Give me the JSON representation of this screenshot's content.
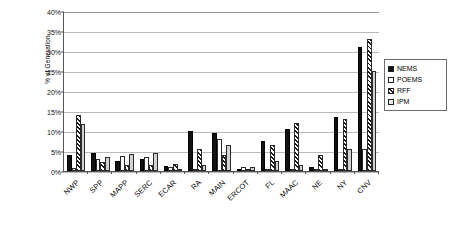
{
  "chart_data": {
    "type": "bar",
    "title": "",
    "xlabel": "",
    "ylabel": "% of Generation",
    "ylim": [
      0,
      40
    ],
    "ytick_labels": [
      "0%",
      "5%",
      "10%",
      "15%",
      "20%",
      "25%",
      "30%",
      "35%",
      "40%"
    ],
    "ytick_values": [
      0,
      5,
      10,
      15,
      20,
      25,
      30,
      35,
      40
    ],
    "grid": true,
    "legend_position": "right",
    "categories": [
      "NWP",
      "SPP",
      "MAPP",
      "SERC",
      "ECAR",
      "RA",
      "MAIN",
      "ERCOT",
      "FL",
      "MAAC",
      "NE",
      "NY",
      "CNV"
    ],
    "series": [
      {
        "name": "NEMS",
        "values": [
          4.1,
          4.6,
          2.6,
          3.0,
          1.3,
          10.0,
          9.5,
          0.4,
          7.5,
          10.5,
          1.0,
          13.5,
          31.0
        ]
      },
      {
        "name": "POEMS",
        "values": [
          0.7,
          3.0,
          3.8,
          3.4,
          1.0,
          0.5,
          8.0,
          0.9,
          0.3,
          0.3,
          0.2,
          0.3,
          5.5
        ]
      },
      {
        "name": "RFF",
        "values": [
          14.0,
          2.3,
          1.4,
          1.6,
          1.8,
          5.5,
          4.0,
          0.3,
          6.5,
          12.0,
          4.0,
          13.0,
          33.0
        ]
      },
      {
        "name": "IPM",
        "values": [
          11.7,
          3.5,
          4.2,
          4.5,
          0.5,
          1.5,
          6.5,
          1.0,
          2.5,
          1.5,
          0.3,
          5.5,
          25.0
        ]
      }
    ],
    "colors": {
      "NEMS": "#111111",
      "POEMS": "#ffffff",
      "RFF": "#ffffff",
      "IPM": "#d2d2d2",
      "grid": "#b9b9b9",
      "axis": "#555555"
    }
  }
}
